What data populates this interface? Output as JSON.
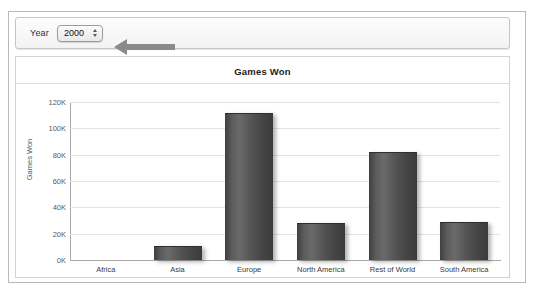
{
  "toolbar": {
    "year_label": "Year",
    "year_value": "2000",
    "stepper_icon": "up-down-stepper-icon",
    "annotation_icon": "left-arrow-annotation-icon"
  },
  "chart_data": {
    "type": "bar",
    "title": "Games Won",
    "xlabel": "",
    "ylabel": "Games Won",
    "categories": [
      "Africa",
      "Asia",
      "Europe",
      "North America",
      "Rest of World",
      "South America"
    ],
    "values": [
      0,
      10000,
      111000,
      27000,
      81000,
      28000
    ],
    "ylim": [
      0,
      120000
    ],
    "ytick_values": [
      0,
      20000,
      40000,
      60000,
      80000,
      100000,
      120000
    ],
    "ytick_labels": [
      "0K",
      "20K",
      "40K",
      "60K",
      "80K",
      "100K",
      "120K"
    ],
    "grid": true,
    "legend": false,
    "bar_color": "#4f4f4f",
    "grid_color": "#e4e4e4",
    "axis_color": "#a8a8a8"
  }
}
